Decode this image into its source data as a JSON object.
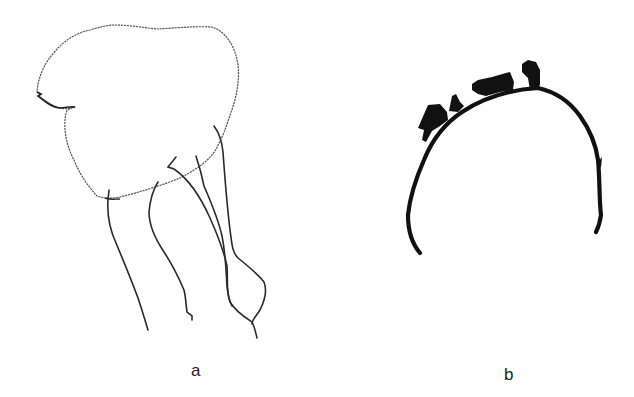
{
  "figure": {
    "panels": [
      {
        "id": "a",
        "label": "a",
        "description": "thin-line outline drawing of a rounded body with four trailing tendrils"
      },
      {
        "id": "b",
        "label": "b",
        "description": "thick arch-shaped outline with dark irregular projections along its upper surface"
      }
    ],
    "colors": {
      "background": "#ffffff",
      "outline_a": "#555555",
      "legs_a": "#2a2a2a",
      "arch_b": "#111111",
      "label": "#222222"
    }
  }
}
